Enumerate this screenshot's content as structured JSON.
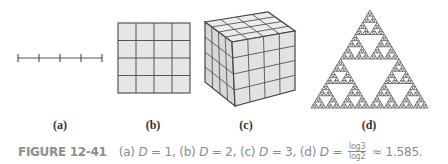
{
  "figure": {
    "panels": [
      {
        "id": "a",
        "label": "(a)",
        "description": "line segment divided into 4 parts",
        "dimension": "1"
      },
      {
        "id": "b",
        "label": "(b)",
        "description": "square divided into 4x4 grid",
        "dimension": "2"
      },
      {
        "id": "c",
        "label": "(c)",
        "description": "cube divided into 4x4x4 cubes",
        "dimension": "3"
      },
      {
        "id": "d",
        "label": "(d)",
        "description": "Sierpinski triangle",
        "dimension": "log3/log2 ≈ 1.585"
      }
    ],
    "caption": {
      "number": "FIGURE 12-41",
      "part_a": "(a) ",
      "part_a_var": "D",
      "part_a_val": " = 1, ",
      "part_b": "(b) ",
      "part_b_var": "D",
      "part_b_val": " = 2, ",
      "part_c": "(c) ",
      "part_c_var": "D",
      "part_c_val": " = 3, ",
      "part_d": "(d) ",
      "part_d_var": "D",
      "part_d_eq": " = ",
      "frac_num": "log3",
      "frac_den": "log2",
      "approx": " ≈ 1.585."
    },
    "colors": {
      "stroke": "#555555",
      "fill": "#e4e4e4",
      "fill_dark": "#d6d6d6",
      "caption": "#8a8a8a"
    }
  }
}
